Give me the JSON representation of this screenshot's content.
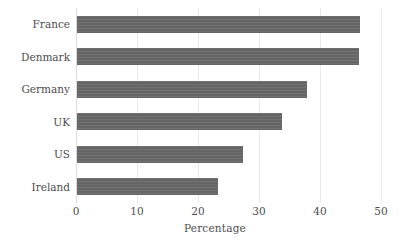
{
  "chart_data": {
    "type": "bar",
    "orientation": "horizontal",
    "title": "",
    "xlabel": "Percentage",
    "ylabel": "",
    "categories": [
      "France",
      "Denmark",
      "Germany",
      "UK",
      "US",
      "Ireland"
    ],
    "values": [
      46.4,
      46.2,
      37.7,
      33.6,
      27.2,
      23.1
    ],
    "series": [
      {
        "name": "Percentage",
        "values": [
          46.4,
          46.2,
          37.7,
          33.6,
          27.2,
          23.1
        ]
      }
    ],
    "xlim": [
      0,
      50
    ],
    "xticks": [
      0,
      10,
      20,
      30,
      40,
      50
    ],
    "xtick_labels": [
      "0",
      "10",
      "20",
      "30",
      "40",
      "50"
    ],
    "grid": "vertical",
    "legend": "none",
    "bar_color": "#6a6a6a",
    "gridline_color": "#e9e9e9",
    "text_color": "#4d4d4d",
    "background_color": "#ffffff"
  }
}
